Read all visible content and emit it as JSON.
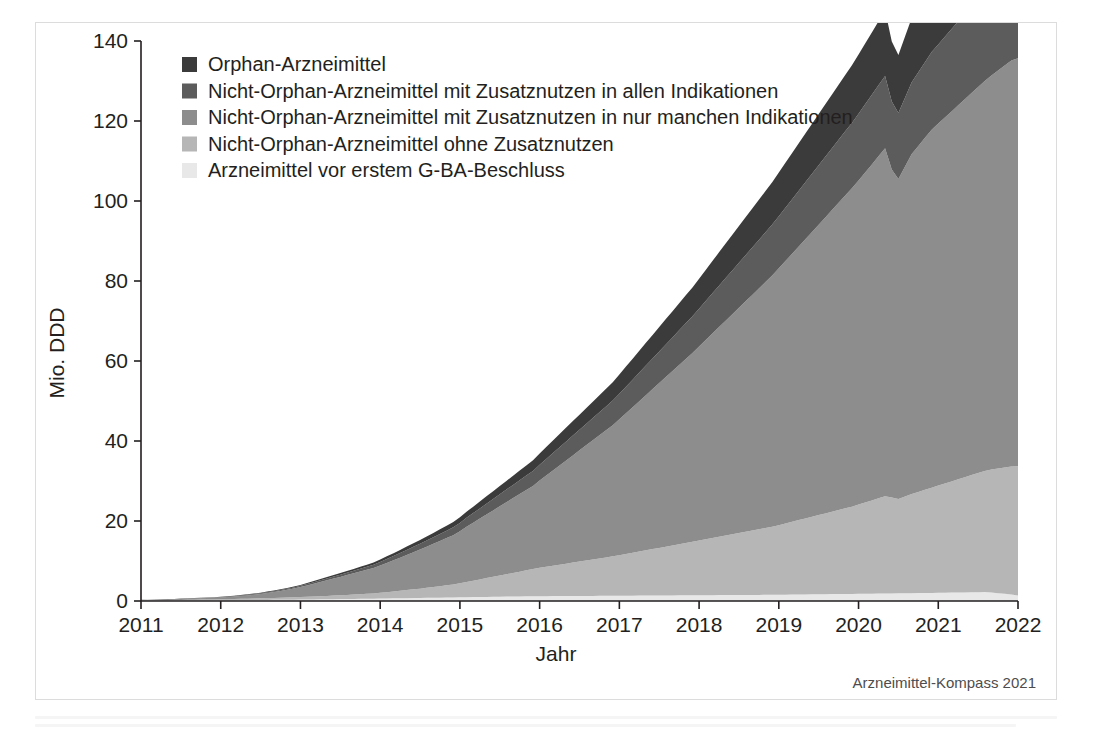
{
  "figure": {
    "source_note": "Arzneimittel-Kompass 2021"
  },
  "chart_data": {
    "type": "area",
    "title": "",
    "subtitle": "",
    "xlabel": "Jahr",
    "ylabel": "Mio. DDD",
    "xlim": [
      2011,
      2022
    ],
    "ylim": [
      0,
      140
    ],
    "ytick_labels": [
      "0",
      "20",
      "40",
      "60",
      "80",
      "100",
      "120",
      "140"
    ],
    "yticks": [
      0,
      20,
      40,
      60,
      80,
      100,
      120,
      140
    ],
    "xtick_labels": [
      "2011",
      "2012",
      "2013",
      "2014",
      "2015",
      "2016",
      "2017",
      "2018",
      "2019",
      "2020",
      "2021",
      "2022"
    ],
    "xticks": [
      2011,
      2012,
      2013,
      2014,
      2015,
      2016,
      2017,
      2018,
      2019,
      2020,
      2021,
      2022
    ],
    "grid": false,
    "legend_position": "top-left",
    "stacked": true,
    "stack_order_bottom_to_top": [
      "Arzneimittel vor erstem G-BA-Beschluss",
      "Nicht-Orphan-Arzneimittel ohne Zusatznutzen",
      "Nicht-Orphan-Arzneimittel mit Zusatznutzen in nur manchen Indikationen",
      "Nicht-Orphan-Arzneimittel mit Zusatznutzen in allen Indikationen",
      "Orphan-Arzneimittel"
    ],
    "colors": {
      "Orphan-Arzneimittel": "#3b3b3b",
      "Nicht-Orphan-Arzneimittel mit Zusatznutzen in allen Indikationen": "#5c5c5c",
      "Nicht-Orphan-Arzneimittel mit Zusatznutzen in nur manchen Indikationen": "#8d8d8d",
      "Nicht-Orphan-Arzneimittel ohne Zusatznutzen": "#b6b6b6",
      "Arzneimittel vor erstem G-BA-Beschluss": "#e8e8e8"
    },
    "legend": [
      {
        "label": "Orphan-Arzneimittel",
        "color": "#3b3b3b"
      },
      {
        "label": "Nicht-Orphan-Arzneimittel mit Zusatznutzen in allen Indikationen",
        "color": "#5c5c5c"
      },
      {
        "label": "Nicht-Orphan-Arzneimittel mit Zusatznutzen in nur manchen Indikationen",
        "color": "#8d8d8d"
      },
      {
        "label": "Nicht-Orphan-Arzneimittel ohne Zusatznutzen",
        "color": "#b6b6b6"
      },
      {
        "label": "Arzneimittel vor erstem G-BA-Beschluss",
        "color": "#e8e8e8"
      }
    ],
    "x": [
      2011.0,
      2011.083,
      2011.167,
      2011.25,
      2011.333,
      2011.417,
      2011.5,
      2011.583,
      2011.667,
      2011.75,
      2011.833,
      2011.917,
      2012.0,
      2012.083,
      2012.167,
      2012.25,
      2012.333,
      2012.417,
      2012.5,
      2012.583,
      2012.667,
      2012.75,
      2012.833,
      2012.917,
      2013.0,
      2013.083,
      2013.167,
      2013.25,
      2013.333,
      2013.417,
      2013.5,
      2013.583,
      2013.667,
      2013.75,
      2013.833,
      2013.917,
      2014.0,
      2014.083,
      2014.167,
      2014.25,
      2014.333,
      2014.417,
      2014.5,
      2014.583,
      2014.667,
      2014.75,
      2014.833,
      2014.917,
      2015.0,
      2015.083,
      2015.167,
      2015.25,
      2015.333,
      2015.417,
      2015.5,
      2015.583,
      2015.667,
      2015.75,
      2015.833,
      2015.917,
      2016.0,
      2016.083,
      2016.167,
      2016.25,
      2016.333,
      2016.417,
      2016.5,
      2016.583,
      2016.667,
      2016.75,
      2016.833,
      2016.917,
      2017.0,
      2017.083,
      2017.167,
      2017.25,
      2017.333,
      2017.417,
      2017.5,
      2017.583,
      2017.667,
      2017.75,
      2017.833,
      2017.917,
      2018.0,
      2018.083,
      2018.167,
      2018.25,
      2018.333,
      2018.417,
      2018.5,
      2018.583,
      2018.667,
      2018.75,
      2018.833,
      2018.917,
      2019.0,
      2019.083,
      2019.167,
      2019.25,
      2019.333,
      2019.417,
      2019.5,
      2019.583,
      2019.667,
      2019.75,
      2019.833,
      2019.917,
      2020.0,
      2020.083,
      2020.167,
      2020.25,
      2020.333,
      2020.417,
      2020.5,
      2020.583,
      2020.667,
      2020.75,
      2020.833,
      2020.917,
      2021.0,
      2021.083,
      2021.167,
      2021.25,
      2021.333,
      2021.417,
      2021.5,
      2021.583,
      2021.667,
      2021.75,
      2021.833,
      2021.917,
      2022.0
    ],
    "series": [
      {
        "name": "Arzneimittel vor erstem G-BA-Beschluss",
        "color": "#e8e8e8",
        "values": [
          0.05,
          0.06,
          0.07,
          0.08,
          0.09,
          0.1,
          0.11,
          0.12,
          0.13,
          0.14,
          0.15,
          0.16,
          0.18,
          0.19,
          0.2,
          0.22,
          0.23,
          0.25,
          0.26,
          0.28,
          0.29,
          0.31,
          0.32,
          0.34,
          0.36,
          0.38,
          0.4,
          0.42,
          0.44,
          0.46,
          0.48,
          0.5,
          0.52,
          0.54,
          0.56,
          0.58,
          0.6,
          0.63,
          0.66,
          0.68,
          0.71,
          0.74,
          0.76,
          0.79,
          0.82,
          0.84,
          0.87,
          0.9,
          0.92,
          0.95,
          0.97,
          1.0,
          1.02,
          1.05,
          1.07,
          1.1,
          1.12,
          1.14,
          1.16,
          1.18,
          1.2,
          1.21,
          1.22,
          1.23,
          1.24,
          1.25,
          1.26,
          1.27,
          1.28,
          1.29,
          1.3,
          1.31,
          1.32,
          1.33,
          1.34,
          1.35,
          1.36,
          1.37,
          1.38,
          1.39,
          1.4,
          1.41,
          1.42,
          1.43,
          1.44,
          1.45,
          1.46,
          1.47,
          1.48,
          1.49,
          1.5,
          1.51,
          1.52,
          1.53,
          1.54,
          1.55,
          1.56,
          1.58,
          1.6,
          1.62,
          1.64,
          1.66,
          1.68,
          1.7,
          1.72,
          1.74,
          1.76,
          1.78,
          1.8,
          1.82,
          1.84,
          1.86,
          1.88,
          1.9,
          1.92,
          1.94,
          1.96,
          1.98,
          2.0,
          2.02,
          2.05,
          2.07,
          2.1,
          2.12,
          2.15,
          2.17,
          2.2,
          2.22,
          2.1,
          1.95,
          1.8,
          1.6,
          1.4
        ]
      },
      {
        "name": "Nicht-Orphan-Arzneimittel ohne Zusatznutzen",
        "color": "#b6b6b6",
        "values": [
          0.1,
          0.11,
          0.12,
          0.13,
          0.14,
          0.15,
          0.17,
          0.18,
          0.19,
          0.21,
          0.22,
          0.24,
          0.26,
          0.28,
          0.3,
          0.33,
          0.35,
          0.38,
          0.41,
          0.44,
          0.47,
          0.5,
          0.54,
          0.58,
          0.62,
          0.67,
          0.72,
          0.77,
          0.83,
          0.89,
          0.95,
          1.02,
          1.09,
          1.16,
          1.24,
          1.32,
          1.45,
          1.58,
          1.72,
          1.86,
          2.01,
          2.17,
          2.33,
          2.5,
          2.68,
          2.86,
          3.05,
          3.25,
          3.5,
          3.8,
          4.1,
          4.4,
          4.7,
          5.0,
          5.3,
          5.6,
          5.9,
          6.2,
          6.5,
          6.8,
          7.1,
          7.35,
          7.6,
          7.85,
          8.1,
          8.35,
          8.6,
          8.85,
          9.1,
          9.35,
          9.6,
          9.85,
          10.1,
          10.4,
          10.7,
          11.0,
          11.3,
          11.6,
          11.9,
          12.2,
          12.5,
          12.8,
          13.1,
          13.4,
          13.7,
          14.0,
          14.3,
          14.6,
          14.9,
          15.2,
          15.5,
          15.8,
          16.1,
          16.4,
          16.7,
          17.0,
          17.4,
          17.8,
          18.2,
          18.6,
          19.0,
          19.4,
          19.8,
          20.2,
          20.6,
          21.0,
          21.4,
          21.8,
          22.3,
          22.8,
          23.3,
          23.8,
          24.3,
          24.0,
          23.6,
          24.2,
          24.8,
          25.3,
          25.8,
          26.3,
          26.8,
          27.3,
          27.8,
          28.3,
          28.8,
          29.3,
          29.8,
          30.3,
          30.8,
          31.2,
          31.6,
          32.0,
          32.3
        ]
      },
      {
        "name": "Nicht-Orphan-Arzneimittel mit Zusatznutzen in nur manchen Indikationen",
        "color": "#8d8d8d",
        "values": [
          0.1,
          0.12,
          0.14,
          0.16,
          0.18,
          0.2,
          0.23,
          0.26,
          0.29,
          0.32,
          0.35,
          0.39,
          0.45,
          0.52,
          0.6,
          0.7,
          0.82,
          0.95,
          1.1,
          1.28,
          1.48,
          1.7,
          1.95,
          2.2,
          2.5,
          2.85,
          3.2,
          3.55,
          3.9,
          4.25,
          4.6,
          4.95,
          5.3,
          5.65,
          6.0,
          6.35,
          6.8,
          7.3,
          7.8,
          8.3,
          8.8,
          9.3,
          9.8,
          10.3,
          10.8,
          11.3,
          11.8,
          12.3,
          13.0,
          13.8,
          14.5,
          15.2,
          15.9,
          16.6,
          17.3,
          18.0,
          18.7,
          19.4,
          20.1,
          20.8,
          21.8,
          22.8,
          23.8,
          24.8,
          25.8,
          26.8,
          27.8,
          28.8,
          29.8,
          30.8,
          31.8,
          32.8,
          34.0,
          35.2,
          36.4,
          37.6,
          38.8,
          40.0,
          41.2,
          42.4,
          43.6,
          44.8,
          46.0,
          47.2,
          48.5,
          49.8,
          51.1,
          52.4,
          53.7,
          55.0,
          56.3,
          57.6,
          58.9,
          60.2,
          61.5,
          62.8,
          64.2,
          65.6,
          67.0,
          68.4,
          69.8,
          71.2,
          72.6,
          74.0,
          75.4,
          76.8,
          78.2,
          79.6,
          81.0,
          82.5,
          84.0,
          85.5,
          87.0,
          82.0,
          80.0,
          82.5,
          85.0,
          86.5,
          88.0,
          89.5,
          90.5,
          91.5,
          92.5,
          93.5,
          94.5,
          95.5,
          96.5,
          97.5,
          98.5,
          99.5,
          100.5,
          101.5,
          102.0
        ]
      },
      {
        "name": "Nicht-Orphan-Arzneimittel mit Zusatznutzen in allen Indikationen",
        "color": "#5c5c5c",
        "values": [
          0.02,
          0.02,
          0.03,
          0.03,
          0.04,
          0.04,
          0.05,
          0.05,
          0.06,
          0.06,
          0.07,
          0.08,
          0.09,
          0.1,
          0.11,
          0.12,
          0.14,
          0.15,
          0.17,
          0.19,
          0.21,
          0.23,
          0.25,
          0.28,
          0.31,
          0.34,
          0.38,
          0.42,
          0.46,
          0.5,
          0.55,
          0.6,
          0.65,
          0.7,
          0.76,
          0.82,
          0.9,
          0.98,
          1.06,
          1.15,
          1.24,
          1.33,
          1.43,
          1.53,
          1.63,
          1.74,
          1.85,
          1.96,
          2.1,
          2.25,
          2.4,
          2.55,
          2.7,
          2.85,
          3.0,
          3.15,
          3.3,
          3.45,
          3.6,
          3.75,
          3.95,
          4.15,
          4.35,
          4.55,
          4.75,
          4.95,
          5.15,
          5.35,
          5.55,
          5.75,
          5.95,
          6.15,
          6.4,
          6.65,
          6.9,
          7.15,
          7.4,
          7.65,
          7.9,
          8.15,
          8.4,
          8.65,
          8.9,
          9.15,
          9.45,
          9.75,
          10.05,
          10.35,
          10.65,
          10.95,
          11.25,
          11.55,
          11.85,
          12.15,
          12.45,
          12.75,
          13.05,
          13.35,
          13.65,
          13.95,
          14.25,
          14.55,
          14.85,
          15.15,
          15.45,
          15.75,
          16.05,
          16.35,
          16.7,
          17.05,
          17.4,
          17.75,
          18.1,
          17.0,
          16.5,
          17.2,
          17.9,
          18.4,
          18.9,
          19.4,
          19.8,
          20.2,
          20.6,
          21.0,
          21.4,
          21.8,
          22.2,
          22.6,
          23.0,
          23.4,
          23.8,
          24.2,
          24.5
        ]
      },
      {
        "name": "Orphan-Arzneimittel",
        "color": "#3b3b3b",
        "values": [
          0.02,
          0.02,
          0.03,
          0.03,
          0.04,
          0.04,
          0.05,
          0.05,
          0.06,
          0.06,
          0.07,
          0.07,
          0.08,
          0.09,
          0.1,
          0.11,
          0.12,
          0.13,
          0.14,
          0.16,
          0.17,
          0.19,
          0.2,
          0.22,
          0.24,
          0.26,
          0.29,
          0.31,
          0.34,
          0.37,
          0.4,
          0.43,
          0.46,
          0.5,
          0.53,
          0.57,
          0.62,
          0.67,
          0.72,
          0.78,
          0.84,
          0.9,
          0.96,
          1.03,
          1.1,
          1.17,
          1.24,
          1.32,
          1.42,
          1.52,
          1.62,
          1.73,
          1.84,
          1.95,
          2.06,
          2.18,
          2.3,
          2.42,
          2.54,
          2.66,
          2.82,
          2.98,
          3.14,
          3.3,
          3.46,
          3.62,
          3.78,
          3.94,
          4.1,
          4.26,
          4.42,
          4.58,
          4.8,
          5.02,
          5.24,
          5.46,
          5.68,
          5.9,
          6.12,
          6.34,
          6.56,
          6.78,
          7.0,
          7.22,
          7.5,
          7.78,
          8.06,
          8.34,
          8.62,
          8.9,
          9.18,
          9.46,
          9.74,
          10.02,
          10.3,
          10.58,
          10.9,
          11.22,
          11.54,
          11.86,
          12.18,
          12.5,
          12.82,
          13.14,
          13.46,
          13.78,
          14.1,
          14.42,
          14.8,
          15.2,
          15.6,
          16.0,
          16.4,
          15.0,
          14.5,
          15.3,
          16.1,
          16.7,
          17.3,
          17.9,
          18.4,
          18.9,
          19.4,
          19.9,
          20.4,
          20.9,
          21.4,
          21.9,
          22.4,
          22.9,
          23.4,
          23.9,
          24.3
        ]
      }
    ],
    "annotations": {
      "peak_total": 139,
      "peak_x": "2022-01",
      "note": "Monatliche Werte mit starkem Sägezahnmuster; Gesamtvolumen wächst von nahe 0 (2011) auf rund 139 Mio. DDD (Anfang 2022)."
    }
  }
}
